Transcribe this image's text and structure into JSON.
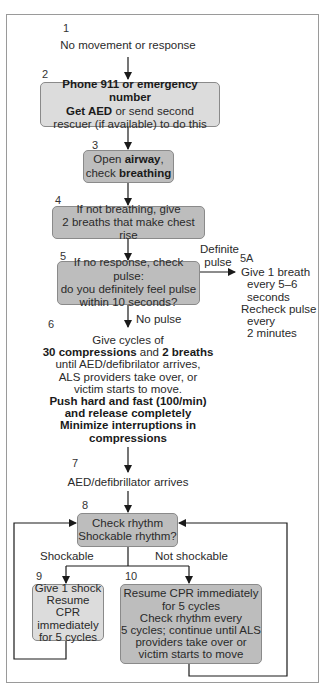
{
  "steps": {
    "s1": {
      "num": "1",
      "text": "No movement or response"
    },
    "s2": {
      "num": "2",
      "line1": "Phone 911 or emergency number",
      "line2_bold": "Get AED",
      "line2_rest": " or send second",
      "line3": "rescuer (if available) to do this"
    },
    "s3": {
      "num": "3",
      "l1a": "Open ",
      "l1b": "airway",
      "l1c": ",",
      "l2a": "check ",
      "l2b": "breathing"
    },
    "s4": {
      "num": "4",
      "line1": "If not breathing, give",
      "line2": "2 breaths that make chest rise"
    },
    "s5": {
      "num": "5",
      "line1": "If no response, check pulse:",
      "line2": "do you definitely feel pulse",
      "line3": "within 10 seconds?"
    },
    "s5a": {
      "num": "5A",
      "branch_label_1": "Definite",
      "branch_label_2": "pulse",
      "line1": "Give 1 breath",
      "line2": "every 5–6",
      "line3": "seconds",
      "line4": "Recheck pulse",
      "line5": "every",
      "line6": "2 minutes"
    },
    "s6": {
      "num": "6",
      "branch_label": "No  pulse",
      "line1": "Give cycles of",
      "line2_b1": "30 compressions",
      "line2_mid": " and ",
      "line2_b2": "2 breaths",
      "line3": "until AED/defibrilator arrives,",
      "line4": "ALS providers take over, or",
      "line5": "victim starts to move.",
      "line6": "Push hard and fast (100/min)",
      "line7": "and release completely",
      "line8": "Minimize interruptions in",
      "line9": "compressions"
    },
    "s7": {
      "num": "7",
      "text": "AED/defibrillator arrives"
    },
    "s8": {
      "num": "8",
      "line1": "Check rhythm",
      "line2": "Shockable rhythm?",
      "left_label": "Shockable",
      "right_label": "Not shockable"
    },
    "s9": {
      "num": "9",
      "line1": "Give 1 shock",
      "line2": "Resume CPR",
      "line3": "immediately",
      "line4": "for 5 cycles"
    },
    "s10": {
      "num": "10",
      "line1": "Resume CPR immediately",
      "line2": "for 5 cycles",
      "line3": "Check rhythm every",
      "line4": "5 cycles; continue until ALS",
      "line5": "providers take over or",
      "line6": "victim starts to move"
    }
  },
  "colors": {
    "light_box": "#dcdcdc",
    "dark_box": "#bdbdbd",
    "line": "#1a1a1a",
    "frame": "#9a9a9a"
  }
}
